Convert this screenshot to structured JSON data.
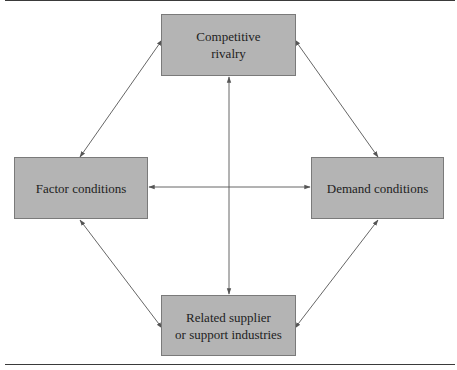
{
  "diagram": {
    "nodes": {
      "top": {
        "label_line1": "Competitive",
        "label_line2": "rivalry"
      },
      "left": {
        "label": "Factor conditions"
      },
      "right": {
        "label": "Demand conditions"
      },
      "bottom": {
        "label_line1": "Related supplier",
        "label_line2": "or support industries"
      }
    },
    "edges": [
      {
        "from": "Competitive rivalry",
        "to": "Factor conditions",
        "type": "bidirectional"
      },
      {
        "from": "Competitive rivalry",
        "to": "Demand conditions",
        "type": "bidirectional"
      },
      {
        "from": "Competitive rivalry",
        "to": "Related supplier or support industries",
        "type": "bidirectional"
      },
      {
        "from": "Factor conditions",
        "to": "Demand conditions",
        "type": "bidirectional"
      },
      {
        "from": "Factor conditions",
        "to": "Related supplier or support industries",
        "type": "bidirectional"
      },
      {
        "from": "Demand conditions",
        "to": "Related supplier or support industries",
        "type": "bidirectional"
      }
    ],
    "colors": {
      "box_fill": "#b4b4b4",
      "box_border": "#7a7a7a",
      "arrow": "#555555",
      "rule": "#3a3a3a"
    }
  }
}
